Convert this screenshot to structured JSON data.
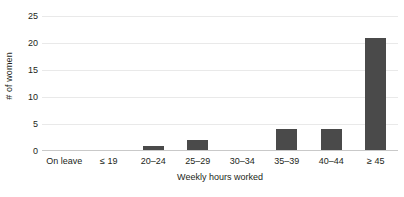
{
  "chart_data": {
    "type": "bar",
    "title": "",
    "xlabel": "Weekly hours worked",
    "ylabel": "# of women",
    "categories": [
      "On leave",
      "≤ 19",
      "20–24",
      "25–29",
      "30–34",
      "35–39",
      "40–44",
      "≥ 45"
    ],
    "values": [
      0,
      0,
      1,
      2,
      0,
      4,
      4,
      21
    ],
    "ylim": [
      0,
      25
    ],
    "yticks": [
      0,
      5,
      10,
      15,
      20,
      25
    ],
    "ytick_labels": [
      "0",
      "5",
      "10",
      "15",
      "20",
      "25"
    ],
    "grid": "horizontal",
    "legend": "none",
    "bar_color": "#4a4a4a",
    "gridline_color": "#e9e9e9",
    "background_color": "#ffffff",
    "text_color": "#231f20"
  }
}
